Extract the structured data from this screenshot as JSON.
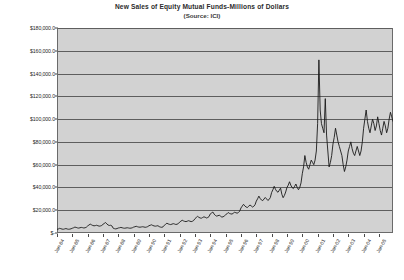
{
  "chart_data": {
    "type": "line",
    "title": "New Sales of Equity Mutual Funds-Millions of Dollars",
    "subtitle": "(Source: ICI)",
    "xlabel": "",
    "ylabel": "",
    "ylim": [
      0,
      180000
    ],
    "ytick_step": 20000,
    "ytick_labels": [
      "$180,000.0",
      "$160,000.0",
      "$140,000.0",
      "$120,000.0",
      "$100,000.0",
      "$80,000.0",
      "$60,000.0",
      "$40,000.0",
      "$20,000.0",
      "$-"
    ],
    "ytick_values": [
      180000,
      160000,
      140000,
      120000,
      100000,
      80000,
      60000,
      40000,
      20000,
      0
    ],
    "xtick_labels": [
      "Jan-84",
      "Jan-85",
      "Jan-86",
      "Jan-87",
      "Jan-88",
      "Jan-89",
      "Jan-90",
      "Jan-91",
      "Jan-92",
      "Jan-93",
      "Jan-94",
      "Jan-95",
      "Jan-96",
      "Jan-97",
      "Jan-98",
      "Jan-99",
      "Jan-00",
      "Jan-01",
      "Jan-02",
      "Jan-03",
      "Jan-04",
      "Jan-05"
    ],
    "grid": true,
    "grid_orientation": "horizontal",
    "legend": false,
    "plot_background": "#d2d2d2",
    "line_color": "#1a1a1a",
    "series": [
      {
        "name": "New Sales of Equity Mutual Funds",
        "x_start": "Jan-84",
        "x_step_months": 1,
        "values": [
          3200,
          3500,
          4100,
          3800,
          3400,
          3300,
          3600,
          3900,
          3500,
          3300,
          3400,
          3700,
          4200,
          4600,
          5200,
          4900,
          4500,
          4300,
          4600,
          4900,
          4700,
          4400,
          4600,
          5100,
          6200,
          7000,
          7800,
          7200,
          6600,
          6300,
          6500,
          6800,
          6400,
          6000,
          6200,
          6600,
          7600,
          8400,
          9200,
          8000,
          7000,
          6600,
          6800,
          6200,
          4200,
          3800,
          3600,
          3900,
          4400,
          4600,
          4900,
          4600,
          4300,
          4200,
          4400,
          4600,
          4400,
          4200,
          4300,
          4600,
          5200,
          5500,
          5900,
          5500,
          5200,
          5100,
          5300,
          5500,
          5300,
          5000,
          5200,
          5600,
          6400,
          6800,
          7200,
          6600,
          6200,
          6000,
          6200,
          6400,
          5600,
          5200,
          5000,
          5400,
          6800,
          7600,
          8600,
          8000,
          7600,
          7400,
          7800,
          8200,
          7900,
          7500,
          7700,
          8300,
          9600,
          10400,
          11200,
          10600,
          10200,
          10000,
          10400,
          10800,
          10400,
          10000,
          10300,
          11000,
          12600,
          13600,
          14600,
          13800,
          13200,
          13000,
          13600,
          14200,
          13800,
          13200,
          13600,
          14400,
          16800,
          17600,
          18400,
          16600,
          15400,
          14800,
          15200,
          15600,
          14800,
          14000,
          14200,
          15000,
          16000,
          16800,
          18000,
          17200,
          16800,
          16600,
          17400,
          18200,
          17800,
          17400,
          18000,
          19200,
          22000,
          23600,
          25200,
          23800,
          22800,
          22400,
          23400,
          24600,
          23800,
          22800,
          23400,
          24800,
          28000,
          30000,
          32400,
          30400,
          29000,
          28400,
          29800,
          31200,
          30000,
          28600,
          29400,
          31200,
          35600,
          38000,
          41000,
          38400,
          36600,
          35800,
          37600,
          39400,
          34000,
          31000,
          33000,
          36000,
          40000,
          42000,
          45000,
          42000,
          40000,
          39000,
          41000,
          43000,
          40000,
          38000,
          40000,
          44000,
          52000,
          58000,
          68000,
          62000,
          58000,
          56000,
          60000,
          64000,
          62000,
          60000,
          64000,
          72000,
          96000,
          152000,
          108000,
          96000,
          92000,
          88000,
          118000,
          86000,
          72000,
          58000,
          62000,
          68000,
          78000,
          84000,
          92000,
          86000,
          80000,
          76000,
          72000,
          68000,
          60000,
          54000,
          58000,
          64000,
          72000,
          76000,
          80000,
          74000,
          70000,
          68000,
          72000,
          76000,
          72000,
          68000,
          72000,
          80000,
          92000,
          100000,
          108000,
          98000,
          92000,
          88000,
          94000,
          100000,
          96000,
          90000,
          94000,
          102000,
          96000,
          90000,
          86000,
          92000,
          98000,
          94000,
          88000,
          92000,
          100000,
          106000,
          102000,
          98000
        ]
      }
    ]
  }
}
